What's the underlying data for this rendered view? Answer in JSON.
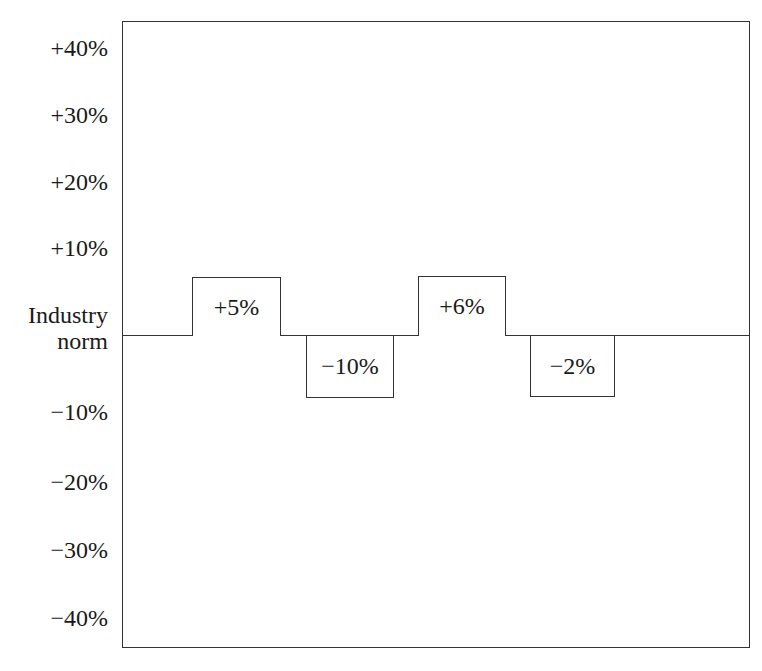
{
  "chart_data": {
    "type": "bar",
    "title": "",
    "xlabel": "",
    "ylabel": "",
    "baseline_label": "Industry norm",
    "categories": [
      "1",
      "2",
      "3",
      "4"
    ],
    "values": [
      5,
      -10,
      6,
      -2
    ],
    "data_labels": [
      "+5%",
      "−10%",
      "+6%",
      "−2%"
    ],
    "ylim": [
      -45,
      45
    ],
    "yticks": [
      "+40%",
      "+30%",
      "+20%",
      "+10%",
      "−10%",
      "−20%",
      "−30%",
      "−40%"
    ],
    "grid": false,
    "legend": null,
    "note": "Bars drawn as uniform-height labeled boxes above/below the industry-norm baseline"
  },
  "axis": {
    "ticks": [
      {
        "label": "+40%",
        "y": 48
      },
      {
        "label": "+30%",
        "y": 115
      },
      {
        "label": "+20%",
        "y": 182
      },
      {
        "label": "+10%",
        "y": 248
      },
      {
        "label": "−10%",
        "y": 412
      },
      {
        "label": "−20%",
        "y": 482
      },
      {
        "label": "−30%",
        "y": 550
      },
      {
        "label": "−40%",
        "y": 618
      }
    ],
    "baseline_line1": "Industry",
    "baseline_line2": "norm"
  },
  "bars": [
    {
      "label": "+5%",
      "left": 192,
      "width": 89,
      "top": 277,
      "height": 59,
      "dir": "up"
    },
    {
      "label": "−10%",
      "left": 306,
      "width": 88,
      "top": 336,
      "height": 62,
      "dir": "down"
    },
    {
      "label": "+6%",
      "left": 418,
      "width": 88,
      "top": 276,
      "height": 60,
      "dir": "up"
    },
    {
      "label": "−2%",
      "left": 530,
      "width": 85,
      "top": 336,
      "height": 61,
      "dir": "down"
    }
  ]
}
